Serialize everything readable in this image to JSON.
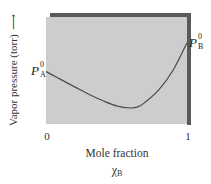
{
  "chart_data": {
    "type": "line",
    "title": "",
    "xlabel": "Mole fraction",
    "xlabel_symbol": "χ",
    "xlabel_symbol_sub": "B",
    "ylabel": "Vapor pressure (torr)",
    "ylabel_arrow": "⟶",
    "x_ticks": [
      "0",
      "1"
    ],
    "xlim": [
      0,
      1
    ],
    "ylim": [
      0,
      1
    ],
    "y_units_note": "schematic, normalized (no numeric y ticks shown)",
    "grid": false,
    "legend": null,
    "annotations": [
      {
        "text": "P",
        "sup": "0",
        "sub": "A",
        "at_x": 0,
        "position": "left"
      },
      {
        "text": "P",
        "sup": "0",
        "sub": "B",
        "at_x": 1,
        "position": "right"
      }
    ],
    "series": [
      {
        "name": "Total vapor pressure (negative deviation)",
        "x": [
          0,
          0.1,
          0.2,
          0.3,
          0.4,
          0.5,
          0.6,
          0.65,
          0.7,
          0.8,
          0.9,
          1.0
        ],
        "y": [
          0.49,
          0.42,
          0.35,
          0.28,
          0.22,
          0.17,
          0.15,
          0.16,
          0.2,
          0.32,
          0.5,
          0.76
        ]
      }
    ],
    "colors": {
      "panel": "#cdcdcd",
      "panel_shadow": "#5a5a5a",
      "curve": "#4a4a4a"
    }
  }
}
